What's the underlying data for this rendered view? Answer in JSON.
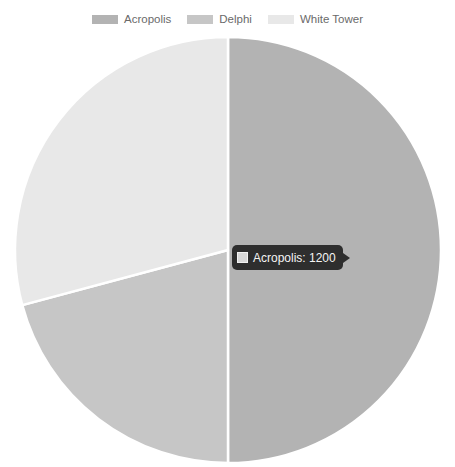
{
  "chart_data": {
    "type": "pie",
    "title": "",
    "categories": [
      "Acropolis",
      "Delphi",
      "White Tower"
    ],
    "values": [
      1200,
      500,
      700
    ],
    "colors": [
      "#b3b3b3",
      "#c6c6c6",
      "#e8e8e8"
    ],
    "legend_position": "top",
    "start_angle_deg": 0,
    "direction": "clockwise",
    "slice_border_color": "#ffffff",
    "slices": [
      {
        "label": "Acropolis",
        "value": 1200,
        "percent": 50.0,
        "color": "#b3b3b3"
      },
      {
        "label": "Delphi",
        "value": 500,
        "percent": 20.8,
        "color": "#c6c6c6"
      },
      {
        "label": "White Tower",
        "value": 700,
        "percent": 29.2,
        "color": "#e8e8e8"
      }
    ]
  },
  "legend": {
    "items": [
      {
        "label": "Acropolis",
        "color": "#b3b3b3"
      },
      {
        "label": "Delphi",
        "color": "#c6c6c6"
      },
      {
        "label": "White Tower",
        "color": "#e8e8e8"
      }
    ]
  },
  "tooltip": {
    "label": "Acropolis",
    "value": "1200",
    "text": "Acropolis: 1200",
    "swatch_color": "#d8d8d8",
    "background": "#2e2e2e"
  }
}
